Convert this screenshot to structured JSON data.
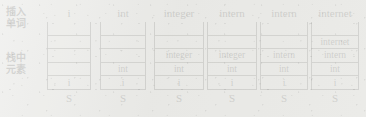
{
  "diagram": {
    "background_color": "#e9e9e6",
    "ink_color": "#2a2a28",
    "row_labels": {
      "insert_word": {
        "line1": "插入",
        "line2": "单词"
      },
      "stack_elements": {
        "line1": "栈中",
        "line2": "元素"
      }
    },
    "stack_name": "S",
    "slot_count": 5,
    "columns": [
      {
        "header": "i",
        "footer": "S",
        "cells": [
          "",
          "",
          "",
          "",
          "i"
        ]
      },
      {
        "header": "int",
        "footer": "S",
        "cells": [
          "",
          "",
          "",
          "int",
          "i"
        ]
      },
      {
        "header": "integer",
        "footer": "S",
        "cells": [
          "",
          "",
          "integer",
          "int",
          "i"
        ]
      },
      {
        "header": "intern",
        "footer": "S",
        "cells": [
          "",
          "",
          "integer",
          "int",
          "i"
        ]
      },
      {
        "header": "intern",
        "footer": "S",
        "cells": [
          "",
          "",
          "intern",
          "int",
          "i"
        ]
      },
      {
        "header": "internet",
        "footer": "S",
        "cells": [
          "",
          "internet",
          "intern",
          "int",
          "i"
        ]
      }
    ]
  }
}
